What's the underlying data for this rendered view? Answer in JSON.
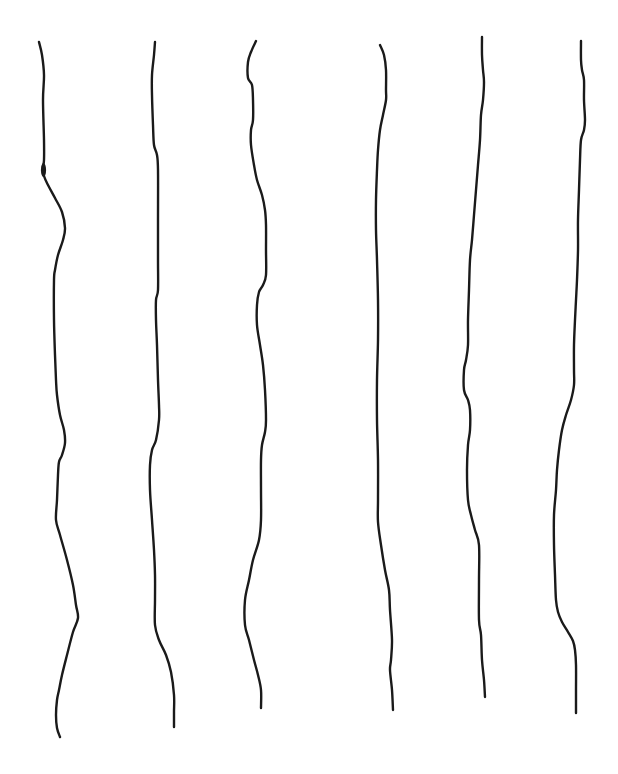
{
  "canvas": {
    "width": 618,
    "height": 774,
    "background": "#ffffff"
  },
  "style": {
    "stroke_color": "#1a1a1a",
    "stroke_width": 2.4
  },
  "lines": [
    {
      "id": "line-1",
      "points": [
        [
          39,
          42
        ],
        [
          42,
          55
        ],
        [
          44,
          75
        ],
        [
          43,
          100
        ],
        [
          44,
          140
        ],
        [
          44,
          160
        ],
        [
          43,
          168
        ],
        [
          44,
          176
        ],
        [
          48,
          185
        ],
        [
          55,
          198
        ],
        [
          62,
          212
        ],
        [
          65,
          228
        ],
        [
          63,
          240
        ],
        [
          58,
          255
        ],
        [
          55,
          270
        ],
        [
          54,
          280
        ],
        [
          54,
          320
        ],
        [
          55,
          355
        ],
        [
          56,
          380
        ],
        [
          57,
          395
        ],
        [
          60,
          415
        ],
        [
          64,
          430
        ],
        [
          65,
          443
        ],
        [
          62,
          455
        ],
        [
          59,
          462
        ],
        [
          58,
          475
        ],
        [
          57,
          500
        ],
        [
          56,
          520
        ],
        [
          60,
          535
        ],
        [
          67,
          560
        ],
        [
          73,
          585
        ],
        [
          76,
          605
        ],
        [
          78,
          618
        ],
        [
          73,
          632
        ],
        [
          67,
          655
        ],
        [
          62,
          675
        ],
        [
          59,
          690
        ],
        [
          57,
          700
        ],
        [
          56,
          715
        ],
        [
          57,
          728
        ],
        [
          60,
          737
        ]
      ]
    },
    {
      "id": "line-2",
      "points": [
        [
          155,
          42
        ],
        [
          154,
          55
        ],
        [
          152,
          75
        ],
        [
          152,
          95
        ],
        [
          153,
          125
        ],
        [
          154,
          145
        ],
        [
          157,
          155
        ],
        [
          158,
          170
        ],
        [
          158,
          220
        ],
        [
          158,
          260
        ],
        [
          158,
          290
        ],
        [
          156,
          300
        ],
        [
          156,
          320
        ],
        [
          157,
          345
        ],
        [
          158,
          380
        ],
        [
          159,
          405
        ],
        [
          159,
          420
        ],
        [
          156,
          440
        ],
        [
          152,
          450
        ],
        [
          150,
          465
        ],
        [
          150,
          490
        ],
        [
          152,
          520
        ],
        [
          154,
          550
        ],
        [
          155,
          575
        ],
        [
          155,
          600
        ],
        [
          155,
          625
        ],
        [
          159,
          640
        ],
        [
          166,
          655
        ],
        [
          171,
          672
        ],
        [
          174,
          695
        ],
        [
          174,
          712
        ],
        [
          174,
          727
        ]
      ]
    },
    {
      "id": "line-3",
      "points": [
        [
          256,
          41
        ],
        [
          251,
          52
        ],
        [
          248,
          62
        ],
        [
          248,
          78
        ],
        [
          252,
          85
        ],
        [
          253,
          100
        ],
        [
          253,
          120
        ],
        [
          251,
          130
        ],
        [
          251,
          145
        ],
        [
          254,
          165
        ],
        [
          257,
          180
        ],
        [
          262,
          195
        ],
        [
          265,
          210
        ],
        [
          266,
          225
        ],
        [
          266,
          250
        ],
        [
          266,
          275
        ],
        [
          263,
          285
        ],
        [
          259,
          292
        ],
        [
          257,
          305
        ],
        [
          257,
          325
        ],
        [
          260,
          345
        ],
        [
          263,
          365
        ],
        [
          265,
          390
        ],
        [
          266,
          420
        ],
        [
          265,
          432
        ],
        [
          262,
          445
        ],
        [
          261,
          460
        ],
        [
          261,
          490
        ],
        [
          261,
          520
        ],
        [
          259,
          540
        ],
        [
          253,
          560
        ],
        [
          249,
          580
        ],
        [
          245,
          600
        ],
        [
          245,
          625
        ],
        [
          249,
          640
        ],
        [
          254,
          660
        ],
        [
          258,
          675
        ],
        [
          261,
          690
        ],
        [
          261,
          708
        ]
      ]
    },
    {
      "id": "line-4",
      "points": [
        [
          380,
          45
        ],
        [
          384,
          55
        ],
        [
          386,
          70
        ],
        [
          386,
          90
        ],
        [
          386,
          100
        ],
        [
          383,
          115
        ],
        [
          380,
          130
        ],
        [
          378,
          150
        ],
        [
          377,
          170
        ],
        [
          376,
          200
        ],
        [
          376,
          230
        ],
        [
          377,
          260
        ],
        [
          378,
          300
        ],
        [
          378,
          340
        ],
        [
          377,
          380
        ],
        [
          377,
          420
        ],
        [
          378,
          460
        ],
        [
          378,
          500
        ],
        [
          378,
          522
        ],
        [
          381,
          545
        ],
        [
          385,
          570
        ],
        [
          389,
          590
        ],
        [
          390,
          610
        ],
        [
          392,
          640
        ],
        [
          391,
          660
        ],
        [
          390,
          670
        ],
        [
          392,
          690
        ],
        [
          393,
          710
        ]
      ]
    },
    {
      "id": "line-5",
      "points": [
        [
          482,
          37
        ],
        [
          482,
          55
        ],
        [
          483,
          70
        ],
        [
          484,
          82
        ],
        [
          483,
          100
        ],
        [
          481,
          115
        ],
        [
          480,
          140
        ],
        [
          478,
          165
        ],
        [
          476,
          190
        ],
        [
          474,
          215
        ],
        [
          472,
          240
        ],
        [
          470,
          260
        ],
        [
          469,
          290
        ],
        [
          468,
          320
        ],
        [
          468,
          345
        ],
        [
          466,
          360
        ],
        [
          464,
          370
        ],
        [
          464,
          390
        ],
        [
          468,
          400
        ],
        [
          470,
          410
        ],
        [
          470,
          430
        ],
        [
          468,
          445
        ],
        [
          467,
          470
        ],
        [
          468,
          500
        ],
        [
          471,
          515
        ],
        [
          475,
          530
        ],
        [
          479,
          545
        ],
        [
          479,
          580
        ],
        [
          479,
          620
        ],
        [
          481,
          635
        ],
        [
          482,
          660
        ],
        [
          484,
          680
        ],
        [
          485,
          697
        ]
      ]
    },
    {
      "id": "line-6",
      "points": [
        [
          581,
          41
        ],
        [
          581,
          60
        ],
        [
          582,
          70
        ],
        [
          584,
          80
        ],
        [
          584,
          100
        ],
        [
          585,
          120
        ],
        [
          584,
          130
        ],
        [
          581,
          140
        ],
        [
          580,
          160
        ],
        [
          579,
          190
        ],
        [
          578,
          220
        ],
        [
          578,
          250
        ],
        [
          577,
          280
        ],
        [
          576,
          300
        ],
        [
          575,
          320
        ],
        [
          574,
          345
        ],
        [
          574,
          370
        ],
        [
          574,
          385
        ],
        [
          571,
          400
        ],
        [
          566,
          415
        ],
        [
          562,
          430
        ],
        [
          559,
          450
        ],
        [
          557,
          470
        ],
        [
          556,
          490
        ],
        [
          554,
          515
        ],
        [
          554,
          545
        ],
        [
          555,
          575
        ],
        [
          556,
          600
        ],
        [
          558,
          612
        ],
        [
          562,
          622
        ],
        [
          568,
          632
        ],
        [
          573,
          641
        ],
        [
          575,
          650
        ],
        [
          576,
          665
        ],
        [
          576,
          690
        ],
        [
          576,
          713
        ]
      ]
    }
  ]
}
